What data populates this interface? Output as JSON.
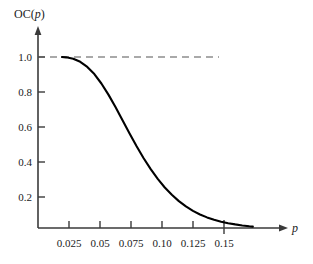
{
  "chart_data": {
    "type": "line",
    "title": "",
    "subtitle": "",
    "ylabel": "OC(p)",
    "xlabel": "p",
    "xlim": [
      0.0,
      0.1725
    ],
    "ylim": [
      0.0,
      1.09
    ],
    "grid": false,
    "legend": null,
    "xticks": [
      0.025,
      0.05,
      0.075,
      0.1,
      0.125,
      0.15
    ],
    "xticklabels": [
      "0.025",
      "0.05",
      "0.075",
      "0.10",
      "0.125",
      "0.15"
    ],
    "yticks": [
      0.2,
      0.4,
      0.6,
      0.8,
      1.0
    ],
    "yticklabels": [
      "0.2",
      "0.4",
      "0.6",
      "0.8",
      "1.0"
    ],
    "series": [
      {
        "name": "OC(p)",
        "style": "solid",
        "color": "#000000",
        "x": [
          0.017,
          0.02,
          0.025,
          0.03,
          0.035,
          0.04,
          0.045,
          0.05,
          0.055,
          0.06,
          0.065,
          0.07,
          0.075,
          0.08,
          0.085,
          0.09,
          0.095,
          0.1,
          0.105,
          0.11,
          0.115,
          0.12,
          0.125,
          0.13,
          0.135,
          0.14,
          0.145,
          0.15,
          0.1525
        ],
        "y": [
          1.0,
          0.998,
          0.99,
          0.972,
          0.942,
          0.9,
          0.845,
          0.78,
          0.707,
          0.63,
          0.553,
          0.478,
          0.408,
          0.344,
          0.287,
          0.237,
          0.194,
          0.157,
          0.126,
          0.1,
          0.079,
          0.062,
          0.048,
          0.037,
          0.028,
          0.021,
          0.015,
          0.01,
          0.008
        ]
      },
      {
        "name": "reference-level-1.0",
        "style": "dashed",
        "color": "#555555",
        "x": [
          0.0,
          0.1285
        ],
        "y": [
          1.0,
          1.0
        ]
      }
    ],
    "annotations": [
      {
        "kind": "axis-arrow",
        "axis": "x"
      },
      {
        "kind": "axis-arrow",
        "axis": "y"
      },
      {
        "kind": "endpoint-tick",
        "x": 0.15,
        "y": 0.0
      }
    ]
  },
  "axes": {
    "y_title_prefix": "OC(",
    "y_title_var": "p",
    "y_title_suffix": ")",
    "x_title": "p"
  }
}
